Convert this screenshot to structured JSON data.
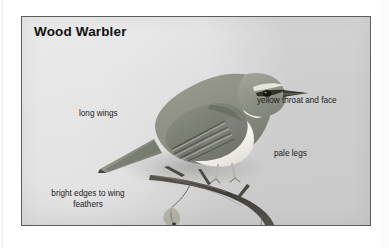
{
  "plate": {
    "title": "Wood Warbler",
    "subject": "perched wood warbler, side view facing right",
    "panel_background_color": "#d9d9d9",
    "panel_border_color": "#5c5c5c",
    "page_background_color": "#ffffff",
    "text_color": "#1c1c1c"
  },
  "annotations": [
    {
      "id": "long-wings",
      "text": "long wings"
    },
    {
      "id": "yellow-throat",
      "text": "yellow throat and face"
    },
    {
      "id": "pale-legs",
      "text": "pale legs"
    },
    {
      "id": "bright-edges",
      "text": "bright edges to wing feathers"
    }
  ],
  "artwork": {
    "bird_upper_color": "#8e9184",
    "bird_lower_color": "#f4f3ef",
    "bird_wing_dark": "#6a6d62",
    "eye_color": "#15140f",
    "branch_color": "#4b4a44",
    "leg_color": "#b9b5ab"
  }
}
